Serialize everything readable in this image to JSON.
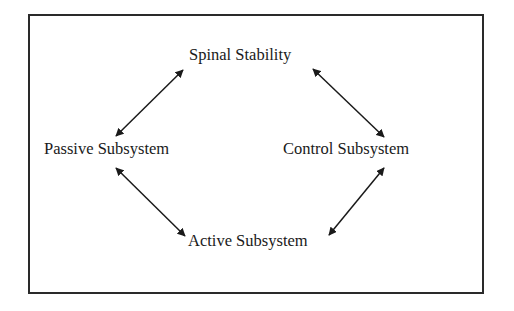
{
  "diagram": {
    "type": "cycle",
    "nodes": [
      {
        "id": "spinal_stability",
        "label": "Spinal Stability",
        "position": "top"
      },
      {
        "id": "passive_subsystem",
        "label": "Passive Subsystem",
        "position": "left"
      },
      {
        "id": "control_subsystem",
        "label": "Control Subsystem",
        "position": "right"
      },
      {
        "id": "active_subsystem",
        "label": "Active Subsystem",
        "position": "bottom"
      }
    ],
    "edges": [
      {
        "from": "spinal_stability",
        "to": "passive_subsystem",
        "direction": "bidirectional"
      },
      {
        "from": "spinal_stability",
        "to": "control_subsystem",
        "direction": "bidirectional"
      },
      {
        "from": "passive_subsystem",
        "to": "active_subsystem",
        "direction": "bidirectional"
      },
      {
        "from": "control_subsystem",
        "to": "active_subsystem",
        "direction": "bidirectional"
      }
    ]
  },
  "colors": {
    "line": "#1a1a1a",
    "border": "#2a2a2a",
    "background": "#ffffff"
  }
}
